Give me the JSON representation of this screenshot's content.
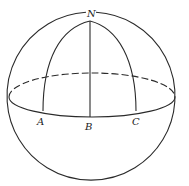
{
  "diagram": {
    "labels": {
      "pole": "N",
      "point_a": "A",
      "point_b": "B",
      "point_c": "C"
    },
    "elements": [
      "sphere-outline",
      "equator-front",
      "equator-back-dashed",
      "meridian-NA",
      "meridian-NB",
      "meridian-NC"
    ],
    "colors": {
      "stroke": "#2a2a2a",
      "background": "#ffffff"
    }
  }
}
